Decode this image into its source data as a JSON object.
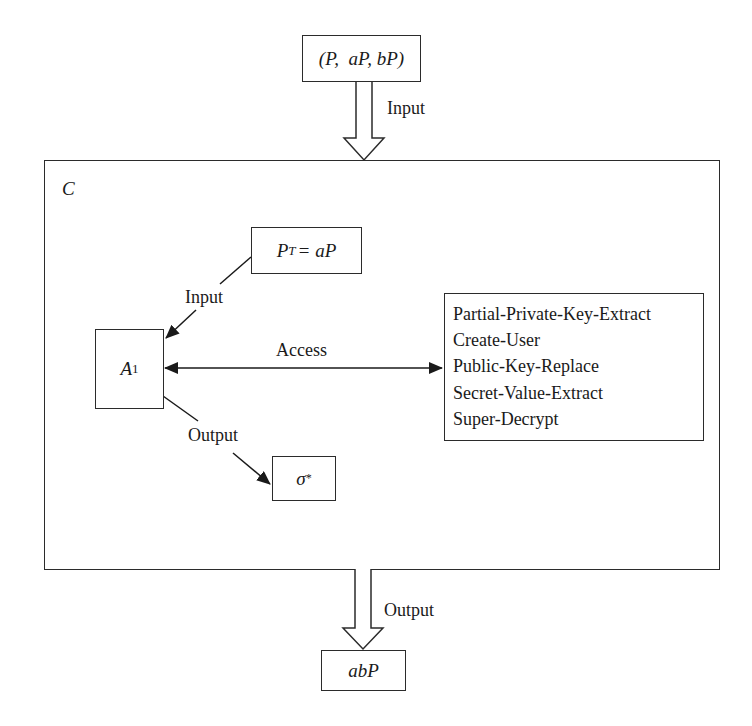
{
  "diagram": {
    "type": "security-game-flow",
    "challenger": {
      "label": "C"
    },
    "input_tuple": {
      "text": "(P,  aP, bP)"
    },
    "input_arrow": {
      "label": "Input"
    },
    "target_key": {
      "lhs": "P",
      "lhs_subscript": "T",
      "rhs": "= aP"
    },
    "adversary": {
      "name": "A",
      "subscript": "1"
    },
    "adversary_input": {
      "label": "Input"
    },
    "access": {
      "label": "Access"
    },
    "oracles": [
      "Partial-Private-Key-Extract",
      "Create-User",
      "Public-Key-Replace",
      "Secret-Value-Extract",
      "Super-Decrypt"
    ],
    "adversary_output": {
      "label": "Output"
    },
    "forgery": {
      "symbol": "σ",
      "superscript": "*"
    },
    "output_arrow": {
      "label": "Output"
    },
    "result": {
      "text": "abP"
    },
    "colors": {
      "stroke": "#2b2b2b",
      "text": "#1a1a1a",
      "background": "#ffffff"
    }
  }
}
